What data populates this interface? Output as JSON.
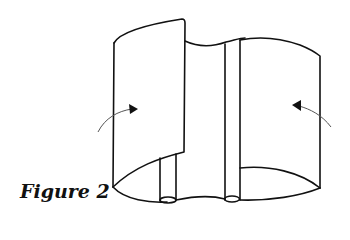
{
  "figure": {
    "caption": "Figure 2",
    "stroke_color": "#111111",
    "arrow_color": "#555555",
    "arrows": [
      {
        "side": "left",
        "direction": "into-blade-right"
      },
      {
        "side": "right",
        "direction": "into-blade-left"
      }
    ]
  }
}
